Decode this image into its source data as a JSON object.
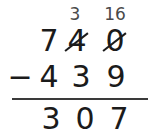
{
  "problem": {
    "operation_symbol": "−",
    "minuend": {
      "hundreds": "7",
      "tens": "4",
      "ones": "0"
    },
    "subtrahend": {
      "hundreds": "4",
      "tens": "3",
      "ones": "9"
    },
    "difference": {
      "hundreds": "3",
      "tens": "0",
      "ones": "7"
    },
    "regrouping": {
      "tens_borrow": "3",
      "ones_borrow": "16"
    }
  },
  "style": {
    "ink_color": "#1b1b1b",
    "pencil_color": "#4a4a4a",
    "rule_color": "#3a3a3a",
    "paper_color": "#ffffff"
  }
}
